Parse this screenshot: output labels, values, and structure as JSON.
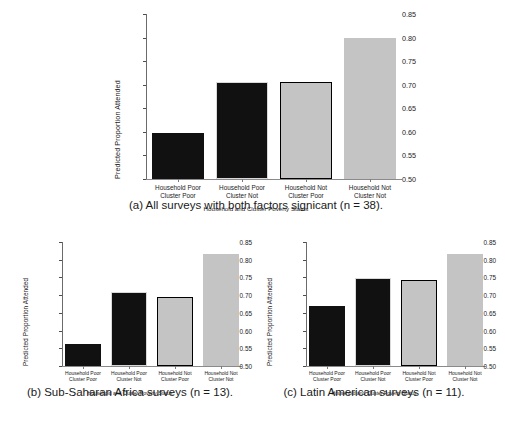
{
  "figure": {
    "background": "#ffffff",
    "colors": {
      "bar_black": "#111111",
      "bar_gray": "#c4c4c4",
      "edge_black": "#000000",
      "edge_light": "#d9d9d9",
      "axis": "#6b6b6b",
      "text": "#1a1a1a"
    }
  },
  "chart_data": [
    {
      "id": "a",
      "type": "bar",
      "title": "",
      "caption": "(a) All surveys with both factors signicant (n = 38).",
      "xlabel": "Household and Cluster Poverty Status",
      "ylabel": "Predicted Proportion Attended",
      "ylim": [
        0.5,
        0.85
      ],
      "yticks": [
        "0.85",
        "0.80",
        "0.75",
        "0.70",
        "0.65",
        "0.60",
        "0.55",
        "0.50"
      ],
      "ytick_values": [
        0.85,
        0.8,
        0.75,
        0.7,
        0.65,
        0.6,
        0.55,
        0.5
      ],
      "grid": false,
      "legend": "none",
      "categories": [
        "Household Poor\nCluster Poor",
        "Household Poor\nCluster Not",
        "Household Not\nCluster Poor",
        "Household Not\nCluster Not"
      ],
      "category_lines": [
        [
          "Household Poor",
          "Cluster Poor"
        ],
        [
          "Household Poor",
          "Cluster Not"
        ],
        [
          "Household Not",
          "Cluster Poor"
        ],
        [
          "Household Not",
          "Cluster Not"
        ]
      ],
      "values": [
        0.598,
        0.706,
        0.705,
        0.799
      ],
      "bar_styles": [
        {
          "fill": "#111111",
          "edge": "#111111"
        },
        {
          "fill": "#111111",
          "edge": "#d9d9d9"
        },
        {
          "fill": "#c4c4c4",
          "edge": "#000000"
        },
        {
          "fill": "#c4c4c4",
          "edge": "#c4c4c4"
        }
      ]
    },
    {
      "id": "b",
      "type": "bar",
      "title": "",
      "caption": "(b) Sub-Saharan Africa surveys (n = 13).",
      "xlabel": "Household and Cluster Poverty Status",
      "ylabel": "Predicted Proportion Attended",
      "ylim": [
        0.5,
        0.85
      ],
      "yticks": [
        "0.85",
        "0.80",
        "0.75",
        "0.70",
        "0.65",
        "0.60",
        "0.55",
        "0.50"
      ],
      "ytick_values": [
        0.85,
        0.8,
        0.75,
        0.7,
        0.65,
        0.6,
        0.55,
        0.5
      ],
      "grid": false,
      "legend": "none",
      "categories": [
        "Household Poor\nCluster Poor",
        "Household Poor\nCluster Not",
        "Household Not\nCluster Poor",
        "Household Not\nCluster Not"
      ],
      "category_lines": [
        [
          "Household Poor",
          "Cluster Poor"
        ],
        [
          "Household Poor",
          "Cluster Not"
        ],
        [
          "Household Not",
          "Cluster Poor"
        ],
        [
          "Household Not",
          "Cluster Not"
        ]
      ],
      "values": [
        0.563,
        0.708,
        0.696,
        0.815
      ],
      "bar_styles": [
        {
          "fill": "#111111",
          "edge": "#111111"
        },
        {
          "fill": "#111111",
          "edge": "#d9d9d9"
        },
        {
          "fill": "#c4c4c4",
          "edge": "#000000"
        },
        {
          "fill": "#c4c4c4",
          "edge": "#c4c4c4"
        }
      ]
    },
    {
      "id": "c",
      "type": "bar",
      "title": "",
      "caption": "(c) Latin American surveys (n = 11).",
      "xlabel": "Household and Cluster Poverty Status",
      "ylabel": "Predicted Proportion Attended",
      "ylim": [
        0.5,
        0.85
      ],
      "yticks": [
        "0.85",
        "0.80",
        "0.75",
        "0.70",
        "0.65",
        "0.60",
        "0.55",
        "0.50"
      ],
      "ytick_values": [
        0.85,
        0.8,
        0.75,
        0.7,
        0.65,
        0.6,
        0.55,
        0.5
      ],
      "grid": false,
      "legend": "none",
      "categories": [
        "Household Poor\nCluster Poor",
        "Household Poor\nCluster Not",
        "Household Not\nCluster Poor",
        "Household Not\nCluster Not"
      ],
      "category_lines": [
        [
          "Household Poor",
          "Cluster Poor"
        ],
        [
          "Household Poor",
          "Cluster Not"
        ],
        [
          "Household Not",
          "Cluster Poor"
        ],
        [
          "Household Not",
          "Cluster Not"
        ]
      ],
      "values": [
        0.668,
        0.749,
        0.744,
        0.815
      ],
      "bar_styles": [
        {
          "fill": "#111111",
          "edge": "#111111"
        },
        {
          "fill": "#111111",
          "edge": "#d9d9d9"
        },
        {
          "fill": "#c4c4c4",
          "edge": "#000000"
        },
        {
          "fill": "#c4c4c4",
          "edge": "#c4c4c4"
        }
      ]
    }
  ]
}
